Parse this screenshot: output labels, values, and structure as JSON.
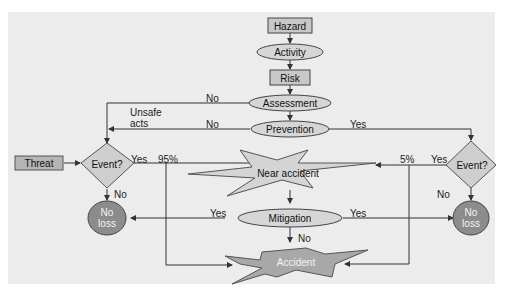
{
  "diagram": {
    "nodes": {
      "hazard": "Hazard",
      "activity": "Activity",
      "risk": "Risk",
      "assessment": "Assessment",
      "prevention": "Prevention",
      "threat": "Threat",
      "event_left": "Event?",
      "event_right": "Event?",
      "near_accident": "Near accident",
      "mitigation": "Mitigation",
      "accident": "Accident",
      "no_loss_left": "No loss",
      "no_loss_right": "No loss"
    },
    "edge_labels": {
      "assessment_no": "No",
      "unsafe_acts": "Unsafe acts",
      "prevention_no": "No",
      "prevention_yes": "Yes",
      "event_left_yes": "Yes",
      "pct_95": "95%",
      "event_left_no": "No",
      "event_right_yes": "Yes",
      "pct_5": "5%",
      "event_right_no": "No",
      "mitigation_yes_left": "Yes",
      "mitigation_yes_right": "Yes",
      "mitigation_no": "No"
    },
    "colors": {
      "background": "#ececec",
      "box_fill": "#c8c8c8",
      "ellipse_fill": "#d6d6d6",
      "diamond_fill": "#cfcfcf",
      "circle_fill": "#8a8a8a",
      "line": "#333333"
    }
  }
}
